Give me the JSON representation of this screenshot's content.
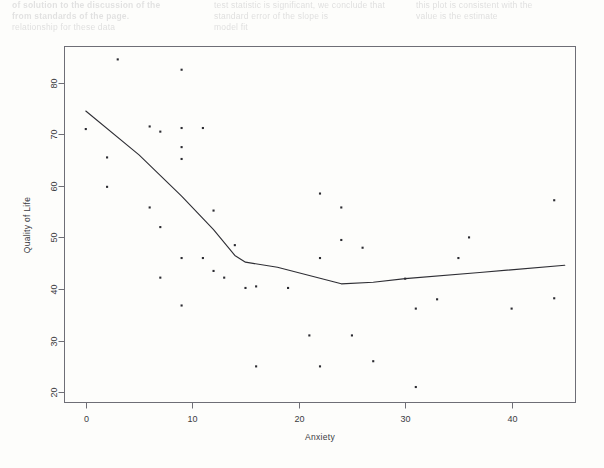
{
  "page": {
    "background_color": "#fdfdfb",
    "bleed_through_text": {
      "description": "faint show-through text from reverse side of scanned page",
      "columns": [
        [
          "of solution to the discussion of the",
          "from standards of the page."
        ],
        [
          "test statistic is significant, we conclude that",
          "standard error of the slope is"
        ],
        [
          "this plot is consistent with the",
          "value is the estimate"
        ],
        [
          "relationship for these data",
          "model fit"
        ]
      ]
    }
  },
  "chart_data": {
    "type": "scatter",
    "title": "",
    "xlabel": "Anxiety",
    "ylabel": "Quality of Life",
    "xlim": [
      -2,
      46
    ],
    "ylim": [
      18,
      87
    ],
    "xticks": [
      0,
      10,
      20,
      30,
      40
    ],
    "yticks": [
      20,
      30,
      40,
      50,
      60,
      70,
      80
    ],
    "grid": false,
    "legend": false,
    "point_color": "#2b2b31",
    "line_color": "#2e2e34",
    "points": [
      {
        "x": 0,
        "y": 71.0
      },
      {
        "x": 2,
        "y": 65.5
      },
      {
        "x": 2,
        "y": 59.8
      },
      {
        "x": 3,
        "y": 84.5
      },
      {
        "x": 6,
        "y": 71.5
      },
      {
        "x": 6,
        "y": 55.8
      },
      {
        "x": 7,
        "y": 70.5
      },
      {
        "x": 7,
        "y": 52.0
      },
      {
        "x": 7,
        "y": 42.2
      },
      {
        "x": 9,
        "y": 82.5
      },
      {
        "x": 9,
        "y": 71.2
      },
      {
        "x": 9,
        "y": 67.5
      },
      {
        "x": 9,
        "y": 65.2
      },
      {
        "x": 9,
        "y": 46.0
      },
      {
        "x": 9,
        "y": 36.8
      },
      {
        "x": 11,
        "y": 71.2
      },
      {
        "x": 11,
        "y": 46.0
      },
      {
        "x": 12,
        "y": 55.2
      },
      {
        "x": 12,
        "y": 43.5
      },
      {
        "x": 13,
        "y": 42.2
      },
      {
        "x": 14,
        "y": 48.5
      },
      {
        "x": 15,
        "y": 40.2
      },
      {
        "x": 16,
        "y": 40.5
      },
      {
        "x": 16,
        "y": 25.0
      },
      {
        "x": 19,
        "y": 40.2
      },
      {
        "x": 21,
        "y": 31.0
      },
      {
        "x": 22,
        "y": 58.5
      },
      {
        "x": 22,
        "y": 46.0
      },
      {
        "x": 22,
        "y": 25.0
      },
      {
        "x": 24,
        "y": 55.8
      },
      {
        "x": 24,
        "y": 49.5
      },
      {
        "x": 25,
        "y": 31.0
      },
      {
        "x": 26,
        "y": 48.0
      },
      {
        "x": 27,
        "y": 26.0
      },
      {
        "x": 30,
        "y": 42.0
      },
      {
        "x": 31,
        "y": 36.2
      },
      {
        "x": 31,
        "y": 21.0
      },
      {
        "x": 33,
        "y": 38.0
      },
      {
        "x": 35,
        "y": 46.0
      },
      {
        "x": 36,
        "y": 50.0
      },
      {
        "x": 40,
        "y": 36.2
      },
      {
        "x": 44,
        "y": 57.2
      },
      {
        "x": 44,
        "y": 38.2
      }
    ],
    "fit_line": {
      "name": "smoothed-fit",
      "points": [
        {
          "x": 0,
          "y": 74.5
        },
        {
          "x": 5,
          "y": 66.0
        },
        {
          "x": 9,
          "y": 58.0
        },
        {
          "x": 12,
          "y": 51.5
        },
        {
          "x": 14,
          "y": 46.5
        },
        {
          "x": 15,
          "y": 45.2
        },
        {
          "x": 18,
          "y": 44.2
        },
        {
          "x": 21,
          "y": 42.6
        },
        {
          "x": 24,
          "y": 41.0
        },
        {
          "x": 27,
          "y": 41.3
        },
        {
          "x": 30,
          "y": 42.0
        },
        {
          "x": 37,
          "y": 43.2
        },
        {
          "x": 45,
          "y": 44.6
        }
      ]
    }
  }
}
